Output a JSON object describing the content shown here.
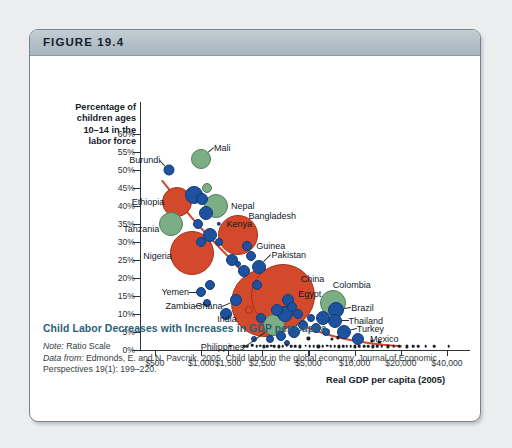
{
  "figure": {
    "number": "FIGURE 19.4",
    "caption_title": "Child Labor Decreases with Increases in GDP per Capita",
    "note_label": "Note:",
    "note_text": " Ratio Scale",
    "source_label": "Data from:",
    "source_text": " Edmonds, E. and N. Pavcnik. 2005. Child labor in the global economy. Journal of Economic Perspectives 19(1): 199–220."
  },
  "colors": {
    "header_band": "#b2bfc7",
    "card_border": "#77848d",
    "page_background": "#ecedef",
    "caption_title": "#2c5f77",
    "bubble_red": "#d2492c",
    "bubble_green": "#7cae85",
    "bubble_blue": "#1e529f",
    "trend_line": "#d2492c",
    "axis": "#2b3136"
  },
  "chart_data": {
    "type": "scatter",
    "title": "Child Labor Decreases with Increases in GDP per Capita",
    "xlabel": "Real GDP per capita (2005)",
    "ylabel": "Percentage of children ages 10–14 in the labor force",
    "xscale": "log",
    "xlim": [
      400,
      50000
    ],
    "ylim": [
      0,
      60
    ],
    "grid": false,
    "legend": "none",
    "x_ticks": [
      "$500",
      "$1,000",
      "$1,500",
      "$2,500",
      "$5,000",
      "$10,000",
      "$20,000",
      "$40,000"
    ],
    "x_tick_values": [
      500,
      1000,
      1500,
      2500,
      5000,
      10000,
      20000,
      40000
    ],
    "y_ticks": [
      "0%",
      "5%",
      "10%",
      "15%",
      "20%",
      "25%",
      "30%",
      "35%",
      "40%",
      "45%",
      "50%",
      "55%",
      "60%"
    ],
    "y_tick_values": [
      0,
      5,
      10,
      15,
      20,
      25,
      30,
      35,
      40,
      45,
      50,
      55,
      60
    ],
    "bubble_meaning": "bubble area = population; color groups countries",
    "points": [
      {
        "name": "Burundi",
        "x": 620,
        "y": 50,
        "r": 5.5,
        "color": "blue",
        "label": true,
        "label_side": "right",
        "label_dx": -9,
        "label_dy": -10
      },
      {
        "name": "Mali",
        "x": 1000,
        "y": 53,
        "r": 10,
        "color": "green",
        "label": true,
        "label_side": "left",
        "label_dx": 13,
        "label_dy": -11
      },
      {
        "name": "Ethiopia",
        "x": 700,
        "y": 41,
        "r": 15,
        "color": "red",
        "label": true,
        "label_side": "right",
        "label_dx": -13,
        "label_dy": 0
      },
      {
        "name": "Tanzania",
        "x": 640,
        "y": 35,
        "r": 12,
        "color": "green",
        "label": true,
        "label_side": "right",
        "label_dx": -12,
        "label_dy": 5
      },
      {
        "name": "Nigeria",
        "x": 870,
        "y": 27,
        "r": 22,
        "color": "red",
        "label": true,
        "label_side": "right",
        "label_dx": -20,
        "label_dy": 3
      },
      {
        "name": "Nepal",
        "x": 1250,
        "y": 40,
        "r": 12,
        "color": "green",
        "label": true,
        "label_side": "left",
        "label_dx": 15,
        "label_dy": 0
      },
      {
        "name": "Kenya",
        "x": 1300,
        "y": 35,
        "r": 2.2,
        "color": "blue",
        "label": true,
        "label_side": "left",
        "label_dx": 8,
        "label_dy": 0
      },
      {
        "name": "Bangladesh",
        "x": 1750,
        "y": 32,
        "r": 20,
        "color": "red",
        "label": true,
        "label_side": "left",
        "label_dx": 10,
        "label_dy": -19
      },
      {
        "name": "Guinea",
        "x": 2000,
        "y": 29,
        "r": 5,
        "color": "blue",
        "label": true,
        "label_side": "left",
        "label_dx": 9,
        "label_dy": 0
      },
      {
        "name": "Pakistan",
        "x": 2400,
        "y": 23,
        "r": 7,
        "color": "blue",
        "label": true,
        "label_side": "left",
        "label_dx": 12,
        "label_dy": -12
      },
      {
        "name": "China",
        "x": 3400,
        "y": 15,
        "r": 32,
        "color": "red",
        "label": true,
        "label_side": "left",
        "label_dx": 18,
        "label_dy": -17
      },
      {
        "name": "Egypt",
        "x": 3700,
        "y": 14,
        "r": 6,
        "color": "blue",
        "label": true,
        "label_side": "left",
        "label_dx": 10,
        "label_dy": -6
      },
      {
        "name": "India",
        "x": 2600,
        "y": 13,
        "r": 34,
        "color": "red",
        "label": true,
        "label_side": "right",
        "label_dx": -28,
        "label_dy": 16
      },
      {
        "name": "Ghana",
        "x": 1700,
        "y": 14,
        "r": 6,
        "color": "blue",
        "label": true,
        "label_side": "right",
        "label_dx": -14,
        "label_dy": 6
      },
      {
        "name": "Philippines",
        "x": 3000,
        "y": 7,
        "r": 11,
        "color": "green",
        "label": true,
        "label_side": "right",
        "label_dx": -30,
        "label_dy": 22
      },
      {
        "name": "Yemen",
        "x": 1000,
        "y": 16,
        "r": 5,
        "color": "blue",
        "label": true,
        "label_side": "right",
        "label_dx": -12,
        "label_dy": 0
      },
      {
        "name": "Zambia",
        "x": 1100,
        "y": 13,
        "r": 4,
        "color": "blue",
        "label": true,
        "label_side": "right",
        "label_dx": -12,
        "label_dy": 3
      },
      {
        "name": "Colombia",
        "x": 7200,
        "y": 13,
        "r": 13,
        "color": "green",
        "label": true,
        "label_side": "left",
        "label_dx": 0,
        "label_dy": -18
      },
      {
        "name": "Brazil",
        "x": 7600,
        "y": 11,
        "r": 8,
        "color": "blue",
        "label": true,
        "label_side": "left",
        "label_dx": 15,
        "label_dy": -2
      },
      {
        "name": "Thailand",
        "x": 7400,
        "y": 8,
        "r": 7,
        "color": "blue",
        "label": true,
        "label_side": "left",
        "label_dx": 14,
        "label_dy": 0
      },
      {
        "name": "Turkey",
        "x": 8500,
        "y": 5,
        "r": 7,
        "color": "blue",
        "label": true,
        "label_side": "left",
        "label_dx": 13,
        "label_dy": -3
      },
      {
        "name": "Mexico",
        "x": 10500,
        "y": 3,
        "r": 6,
        "color": "blue",
        "label": true,
        "label_side": "left",
        "label_dx": 12,
        "label_dy": 0
      }
    ],
    "unlabeled_bubbles": [
      {
        "x": 900,
        "y": 43,
        "r": 9,
        "color": "blue"
      },
      {
        "x": 1020,
        "y": 42,
        "r": 6,
        "color": "blue"
      },
      {
        "x": 1100,
        "y": 45,
        "r": 5,
        "color": "green"
      },
      {
        "x": 1080,
        "y": 38,
        "r": 7,
        "color": "blue"
      },
      {
        "x": 960,
        "y": 35,
        "r": 5,
        "color": "blue"
      },
      {
        "x": 1150,
        "y": 32,
        "r": 7,
        "color": "blue"
      },
      {
        "x": 1300,
        "y": 30,
        "r": 4,
        "color": "blue"
      },
      {
        "x": 1000,
        "y": 30,
        "r": 5,
        "color": "blue"
      },
      {
        "x": 1600,
        "y": 25,
        "r": 6,
        "color": "blue"
      },
      {
        "x": 1750,
        "y": 24,
        "r": 3,
        "color": "blue"
      },
      {
        "x": 1900,
        "y": 22,
        "r": 6,
        "color": "blue"
      },
      {
        "x": 2100,
        "y": 26,
        "r": 5,
        "color": "blue"
      },
      {
        "x": 2300,
        "y": 18,
        "r": 5,
        "color": "blue"
      },
      {
        "x": 1450,
        "y": 10,
        "r": 6,
        "color": "blue"
      },
      {
        "x": 1150,
        "y": 18,
        "r": 5,
        "color": "blue"
      },
      {
        "x": 2050,
        "y": 11,
        "r": 4,
        "color": "red"
      },
      {
        "x": 2450,
        "y": 9,
        "r": 5,
        "color": "blue"
      },
      {
        "x": 3100,
        "y": 11,
        "r": 6,
        "color": "blue"
      },
      {
        "x": 3500,
        "y": 10,
        "r": 8,
        "color": "blue"
      },
      {
        "x": 3900,
        "y": 12,
        "r": 5,
        "color": "blue"
      },
      {
        "x": 4300,
        "y": 10,
        "r": 5,
        "color": "blue"
      },
      {
        "x": 4600,
        "y": 7,
        "r": 5,
        "color": "blue"
      },
      {
        "x": 4000,
        "y": 5,
        "r": 6,
        "color": "blue"
      },
      {
        "x": 3300,
        "y": 4,
        "r": 5,
        "color": "blue"
      },
      {
        "x": 5200,
        "y": 9,
        "r": 4,
        "color": "blue"
      },
      {
        "x": 5600,
        "y": 6,
        "r": 5,
        "color": "blue"
      },
      {
        "x": 6200,
        "y": 9,
        "r": 7,
        "color": "blue"
      },
      {
        "x": 6500,
        "y": 5,
        "r": 4,
        "color": "blue"
      },
      {
        "x": 2800,
        "y": 3,
        "r": 4,
        "color": "blue"
      },
      {
        "x": 3600,
        "y": 2,
        "r": 3,
        "color": "blue"
      },
      {
        "x": 2200,
        "y": 3,
        "r": 3,
        "color": "blue"
      }
    ],
    "baseline_dots": [
      {
        "x": 1550,
        "y": 1.2,
        "r": 1.3
      },
      {
        "x": 1900,
        "y": 1.0,
        "r": 1.3
      },
      {
        "x": 2000,
        "y": 1.0,
        "r": 1.3
      },
      {
        "x": 2150,
        "y": 1.3,
        "r": 1.3
      },
      {
        "x": 2300,
        "y": 1.0,
        "r": 1.3
      },
      {
        "x": 2420,
        "y": 1.2,
        "r": 1.3
      },
      {
        "x": 2550,
        "y": 1.0,
        "r": 1.6
      },
      {
        "x": 2700,
        "y": 1.0,
        "r": 1.3
      },
      {
        "x": 2850,
        "y": 1.2,
        "r": 1.3
      },
      {
        "x": 3000,
        "y": 1.0,
        "r": 1.3
      },
      {
        "x": 3200,
        "y": 1.0,
        "r": 1.6
      },
      {
        "x": 3400,
        "y": 1.0,
        "r": 1.3
      },
      {
        "x": 3600,
        "y": 1.3,
        "r": 1.3
      },
      {
        "x": 3850,
        "y": 1.0,
        "r": 1.3
      },
      {
        "x": 4100,
        "y": 1.0,
        "r": 1.3
      },
      {
        "x": 4400,
        "y": 1.0,
        "r": 1.6
      },
      {
        "x": 4800,
        "y": 1.2,
        "r": 1.3
      },
      {
        "x": 5100,
        "y": 1.0,
        "r": 1.3
      },
      {
        "x": 5400,
        "y": 1.0,
        "r": 1.3
      },
      {
        "x": 5800,
        "y": 1.0,
        "r": 1.6
      },
      {
        "x": 6200,
        "y": 1.0,
        "r": 1.3
      },
      {
        "x": 6600,
        "y": 1.2,
        "r": 1.3
      },
      {
        "x": 7000,
        "y": 1.0,
        "r": 1.3
      },
      {
        "x": 7400,
        "y": 1.0,
        "r": 1.3
      },
      {
        "x": 7900,
        "y": 1.0,
        "r": 1.6
      },
      {
        "x": 8400,
        "y": 1.0,
        "r": 1.3
      },
      {
        "x": 8900,
        "y": 1.0,
        "r": 1.3
      },
      {
        "x": 9400,
        "y": 1.0,
        "r": 1.3
      },
      {
        "x": 10000,
        "y": 1.0,
        "r": 1.6
      },
      {
        "x": 10700,
        "y": 1.0,
        "r": 1.3
      },
      {
        "x": 11500,
        "y": 1.0,
        "r": 1.3
      },
      {
        "x": 12300,
        "y": 1.0,
        "r": 1.3
      },
      {
        "x": 13200,
        "y": 1.0,
        "r": 1.6
      },
      {
        "x": 14000,
        "y": 1.0,
        "r": 1.3
      },
      {
        "x": 15000,
        "y": 1.0,
        "r": 1.3
      },
      {
        "x": 16500,
        "y": 1.0,
        "r": 1.6
      },
      {
        "x": 18000,
        "y": 1.0,
        "r": 1.3
      },
      {
        "x": 19500,
        "y": 1.0,
        "r": 1.3
      },
      {
        "x": 22000,
        "y": 1.0,
        "r": 1.6
      },
      {
        "x": 24000,
        "y": 1.0,
        "r": 1.3
      },
      {
        "x": 26000,
        "y": 1.0,
        "r": 1.3
      },
      {
        "x": 29000,
        "y": 1.0,
        "r": 1.3
      },
      {
        "x": 33000,
        "y": 1.0,
        "r": 1.3
      },
      {
        "x": 41000,
        "y": 1.0,
        "r": 1.3
      },
      {
        "x": 7100,
        "y": 3.0,
        "r": 1.6
      },
      {
        "x": 7800,
        "y": 3.5,
        "r": 1.6
      },
      {
        "x": 5000,
        "y": 3.2,
        "r": 1.6
      },
      {
        "x": 13000,
        "y": 2.5,
        "r": 1.6
      },
      {
        "x": 14500,
        "y": 2.2,
        "r": 1.6
      }
    ],
    "trend_line": [
      {
        "x": 560,
        "y": 47
      },
      {
        "x": 900,
        "y": 36
      },
      {
        "x": 1500,
        "y": 26
      },
      {
        "x": 2500,
        "y": 16
      },
      {
        "x": 4000,
        "y": 8
      },
      {
        "x": 7000,
        "y": 4
      },
      {
        "x": 12000,
        "y": 2
      },
      {
        "x": 20000,
        "y": 1
      }
    ]
  }
}
